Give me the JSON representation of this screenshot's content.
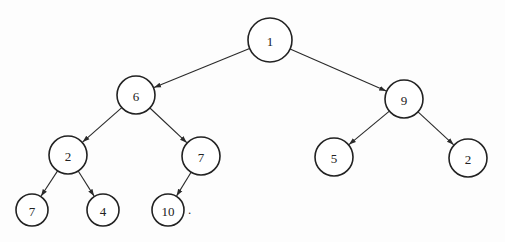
{
  "diagram": {
    "type": "binary-tree",
    "style": {
      "line_color": "#2a2a2a",
      "node_stroke": "#222222",
      "node_fill": "#ffffff",
      "background": "#fdfdfd"
    },
    "nodes": [
      {
        "id": "n1",
        "label": "1",
        "cx": 270,
        "cy": 40,
        "r": 22
      },
      {
        "id": "n6",
        "label": "6",
        "cx": 136,
        "cy": 95,
        "r": 19
      },
      {
        "id": "n9",
        "label": "9",
        "cx": 404,
        "cy": 99,
        "r": 19
      },
      {
        "id": "n2a",
        "label": "2",
        "cx": 68,
        "cy": 155,
        "r": 19
      },
      {
        "id": "n7a",
        "label": "7",
        "cx": 201,
        "cy": 156,
        "r": 19
      },
      {
        "id": "n5",
        "label": "5",
        "cx": 334,
        "cy": 157,
        "r": 19
      },
      {
        "id": "n2b",
        "label": "2",
        "cx": 468,
        "cy": 158,
        "r": 19
      },
      {
        "id": "n7b",
        "label": "7",
        "cx": 32,
        "cy": 210,
        "r": 16
      },
      {
        "id": "n4",
        "label": "4",
        "cx": 103,
        "cy": 210,
        "r": 16
      },
      {
        "id": "n10",
        "label": "10",
        "cx": 168,
        "cy": 210,
        "r": 16
      }
    ],
    "edges": [
      {
        "from": "n1",
        "to": "n6"
      },
      {
        "from": "n1",
        "to": "n9"
      },
      {
        "from": "n6",
        "to": "n2a"
      },
      {
        "from": "n6",
        "to": "n7a"
      },
      {
        "from": "n9",
        "to": "n5"
      },
      {
        "from": "n9",
        "to": "n2b"
      },
      {
        "from": "n2a",
        "to": "n7b"
      },
      {
        "from": "n2a",
        "to": "n4"
      },
      {
        "from": "n7a",
        "to": "n10"
      }
    ],
    "trailing_mark": {
      "text": ".",
      "x": 188,
      "y": 214
    }
  }
}
